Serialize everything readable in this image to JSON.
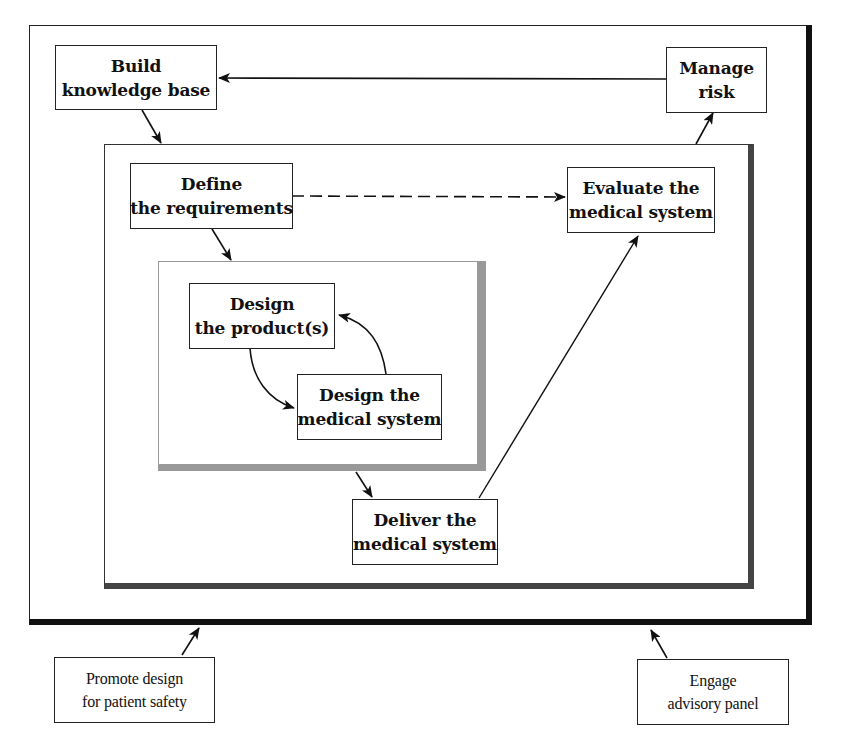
{
  "diagram": {
    "frames": {
      "outer": "outer-context-frame",
      "middle": "system-lifecycle-frame",
      "inner": "design-iteration-frame"
    },
    "nodes": {
      "build_knowledge_base": {
        "line1": "Build",
        "line2": "knowledge base"
      },
      "manage_risk": {
        "line1": "Manage",
        "line2": "risk"
      },
      "define_requirements": {
        "line1": "Define",
        "line2": "the requirements"
      },
      "evaluate_system": {
        "line1": "Evaluate the",
        "line2": "medical system"
      },
      "design_products": {
        "line1": "Design",
        "line2": "the product(s)"
      },
      "design_system": {
        "line1": "Design the",
        "line2": "medical system"
      },
      "deliver_system": {
        "line1": "Deliver the",
        "line2": "medical system"
      },
      "promote_design": {
        "line1": "Promote design",
        "line2": "for patient safety"
      },
      "engage_panel": {
        "line1": "Engage",
        "line2": "advisory panel"
      }
    },
    "edges": [
      {
        "from": "Manage risk",
        "to": "Build knowledge base",
        "style": "solid"
      },
      {
        "from": "Build knowledge base",
        "to": "system-lifecycle-frame",
        "style": "solid"
      },
      {
        "from": "Define the requirements",
        "to": "Evaluate the medical system",
        "style": "dashed"
      },
      {
        "from": "Define the requirements",
        "to": "design-iteration-frame",
        "style": "solid"
      },
      {
        "from": "Design the product(s)",
        "to": "Design the medical system",
        "style": "curved"
      },
      {
        "from": "Design the medical system",
        "to": "Design the product(s)",
        "style": "curved"
      },
      {
        "from": "design-iteration-frame",
        "to": "Deliver the medical system",
        "style": "solid"
      },
      {
        "from": "Deliver the medical system",
        "to": "Evaluate the medical system",
        "style": "solid"
      },
      {
        "from": "system-lifecycle-frame",
        "to": "Manage risk",
        "style": "solid"
      },
      {
        "from": "Promote design for patient safety",
        "to": "outer-context-frame",
        "style": "solid"
      },
      {
        "from": "Engage advisory panel",
        "to": "outer-context-frame",
        "style": "solid"
      }
    ]
  }
}
